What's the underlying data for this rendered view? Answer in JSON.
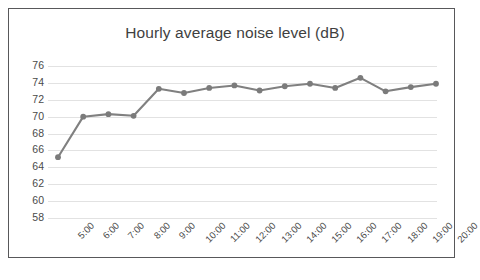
{
  "chart_data": {
    "type": "line",
    "title": "Hourly average noise level (dB)",
    "xlabel": "",
    "ylabel": "",
    "categories": [
      "5:00",
      "6:00",
      "7:00",
      "8:00",
      "9:00",
      "10:00",
      "11:00",
      "12:00",
      "13:00",
      "14:00",
      "15:00",
      "16:00",
      "17:00",
      "18:00",
      "19:00",
      "20:00"
    ],
    "values": [
      65.2,
      70.0,
      70.3,
      70.1,
      73.3,
      72.8,
      73.4,
      73.7,
      73.1,
      73.6,
      73.9,
      73.4,
      74.6,
      73.0,
      73.5,
      73.9
    ],
    "ylim": [
      58,
      76
    ],
    "yticks": [
      76,
      74,
      72,
      70,
      68,
      66,
      64,
      62,
      60,
      58
    ],
    "ytick_step": 2,
    "grid": true,
    "legend": false,
    "series_color": "#808080",
    "marker": "circle",
    "marker_color": "#7b7b7b",
    "gridline_color": "#e2e2e2",
    "border_color": "#58585a",
    "background": "#ffffff",
    "title_color": "#3f3f3f",
    "tick_label_color": "#4a4a4a",
    "xtick_rotation": -45
  }
}
